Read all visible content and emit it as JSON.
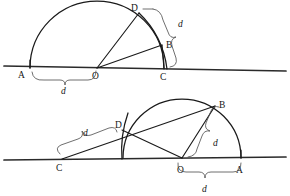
{
  "figure": {
    "stroke_color": "#1a1a1a",
    "baseline_color": "#2a2a2a",
    "brace_color": "#4a4a4a",
    "background": "#ffffff",
    "distance_symbol": "d"
  },
  "top_diagram": {
    "name": "upper-construction",
    "points": [
      {
        "id": "A",
        "label": "A",
        "x": 30,
        "y": 68,
        "label_x": 18,
        "label_y": 78
      },
      {
        "id": "O",
        "label": "O",
        "x": 97,
        "y": 68,
        "label_x": 92,
        "label_y": 79
      },
      {
        "id": "C",
        "label": "C",
        "x": 164,
        "y": 68,
        "label_x": 160,
        "label_y": 80
      },
      {
        "id": "B",
        "label": "B",
        "x": 162,
        "y": 44,
        "label_x": 166,
        "label_y": 45
      },
      {
        "id": "D",
        "label": "D",
        "x": 139,
        "y": 13,
        "label_x": 132,
        "label_y": 11
      }
    ],
    "baseline": {
      "x1": 4,
      "y1": 66,
      "x2": 286,
      "y2": 71
    },
    "semicircle": {
      "cx": 97,
      "cy": 68,
      "r": 67,
      "from_x": 30,
      "to_x": 164
    },
    "segments": [
      {
        "from": "O",
        "to": "D"
      },
      {
        "from": "O",
        "to": "B"
      },
      {
        "from": "B",
        "to": "C"
      }
    ],
    "inner_arc": {
      "from": "D",
      "to": "C",
      "note": "arc of radius OD centred near O sweeping D down to C"
    },
    "distance_labels": [
      {
        "id": "d-bottom-left",
        "text": "d",
        "x": 64,
        "y": 92,
        "span_from": "A",
        "span_to": "O"
      },
      {
        "id": "d-right",
        "text": "d",
        "x": 181,
        "y": 25,
        "span_from": "D",
        "span_to": "C"
      }
    ]
  },
  "bottom_diagram": {
    "name": "lower-construction",
    "points": [
      {
        "id": "C",
        "label": "C",
        "x": 62,
        "y": 158,
        "label_x": 56,
        "label_y": 170
      },
      {
        "id": "O",
        "label": "O",
        "x": 182,
        "y": 158,
        "label_x": 177,
        "label_y": 172
      },
      {
        "id": "A",
        "label": "A",
        "x": 241,
        "y": 158,
        "label_x": 236,
        "label_y": 172
      },
      {
        "id": "D",
        "label": "D",
        "x": 122,
        "y": 130,
        "label_x": 116,
        "label_y": 127
      },
      {
        "id": "B",
        "label": "B",
        "x": 215,
        "y": 105,
        "label_x": 220,
        "label_y": 105
      }
    ],
    "baseline": {
      "x1": 4,
      "y1": 160,
      "x2": 286,
      "y2": 157
    },
    "semicircle": {
      "cx": 182,
      "cy": 158,
      "r": 59,
      "from_x": 123,
      "to_x": 241
    },
    "segments": [
      {
        "from": "C",
        "to": "B",
        "note": "straight line passing through D"
      },
      {
        "from": "D",
        "to": "O"
      },
      {
        "from": "O",
        "to": "B"
      }
    ],
    "inner_arc": {
      "from": "D",
      "to": "baseline",
      "note": "small arc through D meeting the baseline"
    },
    "distance_labels": [
      {
        "id": "d-left",
        "text": "d",
        "x": 86,
        "y": 133,
        "span_from": "C",
        "span_to": "D"
      },
      {
        "id": "d-mid",
        "text": "d",
        "x": 217,
        "y": 143,
        "span_from": "O",
        "span_to": "B"
      },
      {
        "id": "d-bottom",
        "text": "d",
        "x": 206,
        "y": 192,
        "span_from": "O",
        "span_to": "A"
      }
    ]
  }
}
